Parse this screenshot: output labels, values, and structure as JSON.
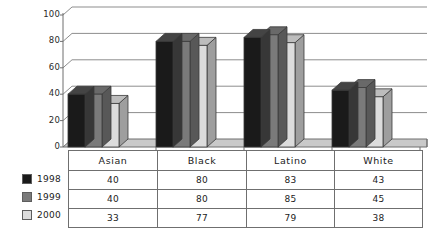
{
  "chart_data": {
    "type": "bar",
    "title": "",
    "subtitle": "",
    "xlabel": "",
    "ylabel": "",
    "categories": [
      "Asian",
      "Black",
      "Latino",
      "White"
    ],
    "series": [
      {
        "name": "1998",
        "values": [
          40,
          80,
          83,
          43
        ],
        "color": "#1a1a1a"
      },
      {
        "name": "1999",
        "values": [
          40,
          80,
          85,
          45
        ],
        "color": "#7a7a7a"
      },
      {
        "name": "2000",
        "values": [
          33,
          77,
          79,
          38
        ],
        "color": "#dcdcdc"
      }
    ],
    "ylim": [
      0,
      100
    ],
    "yticks": [
      0,
      20,
      40,
      60,
      80,
      100
    ],
    "ytick_labels": [
      "0",
      "20",
      "40",
      "60",
      "80",
      "100"
    ],
    "grid": true,
    "grid_axis": "y",
    "legend_position": "left-bottom",
    "style": "3d-column",
    "has_data_table": true
  },
  "axis": {
    "ytick_labels": [
      "100",
      "80",
      "60",
      "40",
      "20",
      "0"
    ]
  },
  "table": {
    "header": [
      "Asian",
      "Black",
      "Latino",
      "White"
    ],
    "rows": [
      {
        "series": "1998",
        "values": [
          "40",
          "80",
          "83",
          "43"
        ]
      },
      {
        "series": "1999",
        "values": [
          "40",
          "80",
          "85",
          "45"
        ]
      },
      {
        "series": "2000",
        "values": [
          "33",
          "77",
          "79",
          "38"
        ]
      }
    ]
  },
  "legend": {
    "items": [
      {
        "label": "1998",
        "color": "#1a1a1a"
      },
      {
        "label": "1999",
        "color": "#7a7a7a"
      },
      {
        "label": "2000",
        "color": "#dcdcdc"
      }
    ]
  },
  "colors": {
    "series_1998": "#1a1a1a",
    "series_1999": "#7a7a7a",
    "series_2000": "#dcdcdc",
    "gridline": "#8d8d8d",
    "axis": "#6f6f6f",
    "background": "#ffffff",
    "floor": "#c9c9c9"
  }
}
